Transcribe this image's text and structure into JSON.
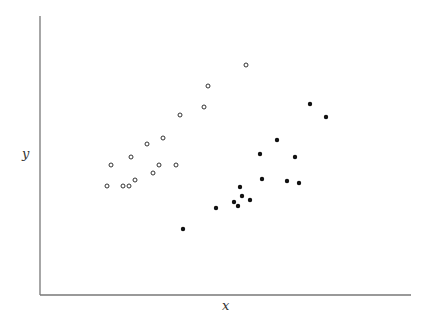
{
  "chart_data": {
    "type": "scatter",
    "title": "",
    "xlabel": "x",
    "ylabel": "y",
    "grid": false,
    "legend": null,
    "ticks": false,
    "axes_px": {
      "x0": 40,
      "x1": 411,
      "y_top": 16,
      "y_axis_bottom": 295
    },
    "series": [
      {
        "name": "open-circles",
        "marker": "open-circle",
        "color": "#333333",
        "points_px": [
          [
            246,
            65
          ],
          [
            208,
            86
          ],
          [
            204,
            107
          ],
          [
            180,
            115
          ],
          [
            163,
            138
          ],
          [
            147,
            144
          ],
          [
            131,
            157
          ],
          [
            111,
            165
          ],
          [
            159,
            165
          ],
          [
            176,
            165
          ],
          [
            153,
            173
          ],
          [
            135,
            180
          ],
          [
            107,
            186
          ],
          [
            123,
            186
          ],
          [
            129,
            186
          ]
        ]
      },
      {
        "name": "filled-dots",
        "marker": "filled-circle",
        "color": "#111111",
        "points_px": [
          [
            310,
            104
          ],
          [
            326,
            117
          ],
          [
            277,
            140
          ],
          [
            260,
            154
          ],
          [
            295,
            157
          ],
          [
            262,
            179
          ],
          [
            287,
            181
          ],
          [
            299,
            183
          ],
          [
            240,
            187
          ],
          [
            242,
            196
          ],
          [
            250,
            200
          ],
          [
            234,
            202
          ],
          [
            238,
            206
          ],
          [
            216,
            208
          ],
          [
            183,
            229
          ]
        ]
      }
    ]
  }
}
